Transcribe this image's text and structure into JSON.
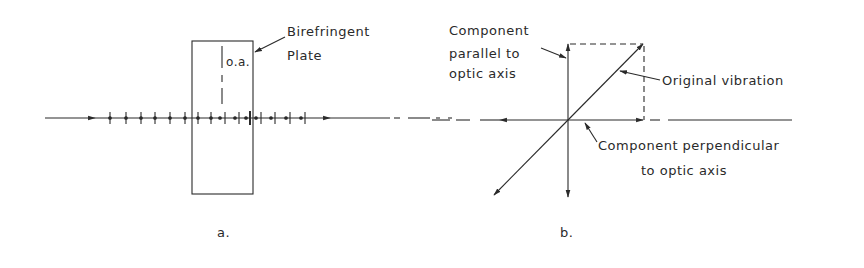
{
  "panel_a": {
    "plate_label_line1": "Birefringent",
    "plate_label_line2": "Plate",
    "optic_axis_label": "o.a.",
    "caption": "a."
  },
  "panel_b": {
    "parallel_label_line1": "Component",
    "parallel_label_line2": "parallel to",
    "parallel_label_line3": "optic axis",
    "original_label": "Original vibration",
    "perp_label_line1": "Component perpendicular",
    "perp_label_line2": "to optic axis",
    "caption": "b."
  },
  "colors": {
    "ink": "#2a2a2a",
    "background": "#ffffff"
  }
}
